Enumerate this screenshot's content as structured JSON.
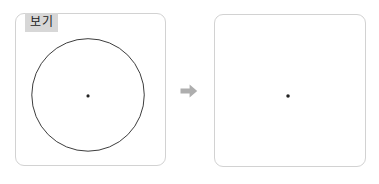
{
  "figure": {
    "type": "geometry-transformation-diagram",
    "background_color": "#ffffff"
  },
  "left_panel": {
    "label": "보기",
    "label_background_color": "#d7d7d7",
    "label_text_color": "#1c1c1c",
    "border_color": "#d2d2d2",
    "background_color": "#ffffff",
    "shapes": {
      "circle": {
        "name": "circle-outline",
        "center_x": 73,
        "center_y": 82,
        "radius": 57,
        "stroke_color": "#3a3a3a",
        "stroke_width": 1,
        "fill": "none"
      },
      "center_dot": {
        "name": "center-point",
        "center_x": 73,
        "center_y": 83,
        "radius": 1.6,
        "fill_color": "#222222"
      }
    }
  },
  "connector": {
    "name": "right-arrow",
    "direction": "right",
    "color": "#aeaeae"
  },
  "right_panel": {
    "label": "",
    "border_color": "#d2d2d2",
    "background_color": "#ffffff",
    "shapes": {
      "center_dot": {
        "name": "center-point",
        "center_x": 74,
        "center_y": 82,
        "radius": 1.8,
        "fill_color": "#222222"
      }
    }
  }
}
